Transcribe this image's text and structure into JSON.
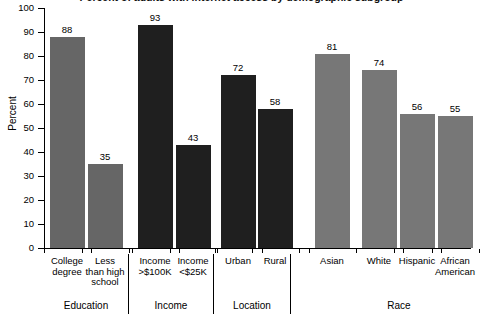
{
  "chart_data": {
    "type": "bar",
    "title": "Percent of adults with internet access by demographic subgroup",
    "xlabel": "",
    "ylabel": "Percent",
    "ylim": [
      0,
      100
    ],
    "ytick_step": 10,
    "ytick_labels": [
      "0",
      "10",
      "20",
      "30",
      "40",
      "50",
      "60",
      "70",
      "80",
      "90",
      "100"
    ],
    "grid": false,
    "legend": "none",
    "categories": [
      "College degree",
      "Less than high school",
      "Income >$100K",
      "Income <$25K",
      "Urban",
      "Rural",
      "Asian",
      "White",
      "Hispanic",
      "African American"
    ],
    "values": [
      88,
      35,
      93,
      43,
      72,
      58,
      81,
      74,
      56,
      55
    ],
    "bar_colors": [
      "#666666",
      "#666666",
      "#1f1f1f",
      "#1f1f1f",
      "#1f1f1f",
      "#1f1f1f",
      "#777777",
      "#777777",
      "#777777",
      "#777777"
    ],
    "groups": [
      {
        "label": "Education",
        "categories": [
          "College degree",
          "Less than high school"
        ]
      },
      {
        "label": "Income",
        "categories": [
          "Income >$100K",
          "Income <$25K"
        ]
      },
      {
        "label": "Location",
        "categories": [
          "Urban",
          "Rural"
        ]
      },
      {
        "label": "Race",
        "categories": [
          "Asian",
          "White",
          "Hispanic",
          "African American"
        ]
      }
    ]
  },
  "axis": {
    "y_label": "Percent",
    "y_ticks": [
      "100",
      "90",
      "80",
      "70",
      "60",
      "50",
      "40",
      "30",
      "20",
      "10",
      "0"
    ]
  },
  "bars": [
    {
      "name": "bar-college-degree",
      "value_label": "88",
      "line1": "College",
      "line2": "degree",
      "line3": ""
    },
    {
      "name": "bar-less-than-hs",
      "value_label": "35",
      "line1": "Less",
      "line2": "than high",
      "line3": "school"
    },
    {
      "name": "bar-income-over-100k",
      "value_label": "93",
      "line1": "Income",
      "line2": ">$100K",
      "line3": ""
    },
    {
      "name": "bar-income-under-25k",
      "value_label": "43",
      "line1": "Income",
      "line2": "<$25K",
      "line3": ""
    },
    {
      "name": "bar-urban",
      "value_label": "72",
      "line1": "Urban",
      "line2": "",
      "line3": ""
    },
    {
      "name": "bar-rural",
      "value_label": "58",
      "line1": "Rural",
      "line2": "",
      "line3": ""
    },
    {
      "name": "bar-asian",
      "value_label": "81",
      "line1": "Asian",
      "line2": "",
      "line3": ""
    },
    {
      "name": "bar-white",
      "value_label": "74",
      "line1": "White",
      "line2": "",
      "line3": ""
    },
    {
      "name": "bar-hispanic",
      "value_label": "56",
      "line1": "Hispanic",
      "line2": "",
      "line3": ""
    },
    {
      "name": "bar-african-american",
      "value_label": "55",
      "line1": "African",
      "line2": "American",
      "line3": ""
    }
  ],
  "groups": [
    {
      "label": "Education"
    },
    {
      "label": "Income"
    },
    {
      "label": "Location"
    },
    {
      "label": "Race"
    }
  ]
}
